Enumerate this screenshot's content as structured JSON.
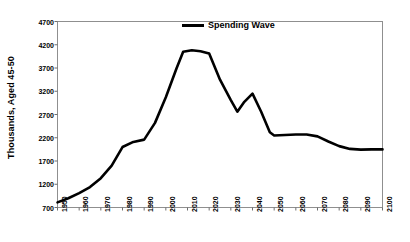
{
  "chart_data": {
    "type": "line",
    "title": "",
    "xlabel": "",
    "ylabel": "Thousands, Aged 45-50",
    "xlim": [
      1950,
      2100
    ],
    "ylim": [
      700,
      4700
    ],
    "ytick_step": 500,
    "xtick_step": 10,
    "grid": false,
    "legend_position": "top-center",
    "yticks": [
      700,
      1200,
      1700,
      2200,
      2700,
      3200,
      3700,
      4200,
      4700
    ],
    "xticks": [
      1950,
      1960,
      1970,
      1980,
      1990,
      2000,
      2010,
      2020,
      2030,
      2040,
      2050,
      2060,
      2070,
      2080,
      2090,
      2100
    ],
    "series": [
      {
        "name": "Spending Wave",
        "color": "#000000",
        "x": [
          1950,
          1955,
          1960,
          1965,
          1970,
          1975,
          1980,
          1985,
          1990,
          1995,
          2000,
          2005,
          2008,
          2012,
          2016,
          2020,
          2025,
          2030,
          2033,
          2036,
          2040,
          2044,
          2048,
          2050,
          2055,
          2060,
          2065,
          2070,
          2075,
          2080,
          2085,
          2090,
          2095,
          2100
        ],
        "values": [
          810,
          900,
          1010,
          1140,
          1330,
          1600,
          2000,
          2110,
          2160,
          2520,
          3070,
          3700,
          4050,
          4080,
          4060,
          4010,
          3450,
          3010,
          2760,
          2960,
          3150,
          2760,
          2320,
          2250,
          2260,
          2270,
          2270,
          2230,
          2120,
          2020,
          1960,
          1945,
          1950,
          1950
        ]
      }
    ]
  },
  "legend": {
    "label": "Spending Wave"
  },
  "axes": {
    "y_title": "Thousands, Aged 45-50"
  }
}
